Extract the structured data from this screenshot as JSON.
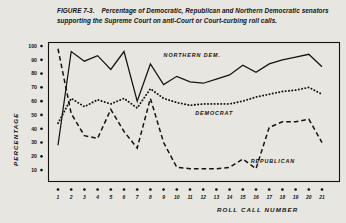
{
  "figure": {
    "number": "FIGURE 7-3.",
    "caption": "Percentage of Democratic, Republican and Northern Democratic senators supporting the Supreme Court on anti-Court or Court-curbing roll calls."
  },
  "chart_data": {
    "type": "line",
    "title": "Percentage of Democratic, Republican and Northern Democratic senators supporting the Supreme Court on anti-Court or Court-curbing roll calls.",
    "xlabel": "ROLL CALL NUMBER",
    "ylabel": "PERCENTAGE",
    "xlim": [
      1,
      21
    ],
    "ylim": [
      0,
      100
    ],
    "yticks": [
      100,
      90,
      80,
      70,
      60,
      50,
      40,
      30,
      20,
      10
    ],
    "xticks": [
      1,
      2,
      3,
      4,
      5,
      6,
      7,
      8,
      9,
      10,
      11,
      12,
      13,
      14,
      15,
      16,
      17,
      18,
      19,
      20,
      21
    ],
    "x": [
      1,
      2,
      3,
      4,
      5,
      6,
      7,
      8,
      9,
      10,
      11,
      12,
      13,
      14,
      15,
      16,
      17,
      18,
      19,
      20,
      21
    ],
    "grid": false,
    "legend": "inline-labels",
    "series": [
      {
        "name": "NORTHERN DEM.",
        "style": "solid",
        "values": [
          28,
          96,
          89,
          93,
          83,
          96,
          60,
          87,
          72,
          78,
          74,
          73,
          76,
          79,
          86,
          81,
          87,
          90,
          92,
          94,
          85
        ]
      },
      {
        "name": "DEMOCRAT",
        "style": "dotted",
        "values": [
          44,
          62,
          56,
          61,
          58,
          62,
          55,
          69,
          62,
          59,
          57,
          58,
          58,
          58,
          60,
          63,
          65,
          67,
          68,
          70,
          65
        ]
      },
      {
        "name": "REPUBLICAN",
        "style": "dashed",
        "values": [
          98,
          51,
          35,
          33,
          54,
          38,
          26,
          62,
          30,
          12,
          11,
          11,
          11,
          12,
          18,
          11,
          41,
          45,
          45,
          47,
          30
        ]
      }
    ],
    "annotations": [
      {
        "text": "NORTHERN DEM.",
        "x": 9.0,
        "y": 92
      },
      {
        "text": "DEMOCRAT",
        "x": 11.4,
        "y": 50
      },
      {
        "text": "REPUBLICAN",
        "x": 15.6,
        "y": 15
      }
    ]
  }
}
